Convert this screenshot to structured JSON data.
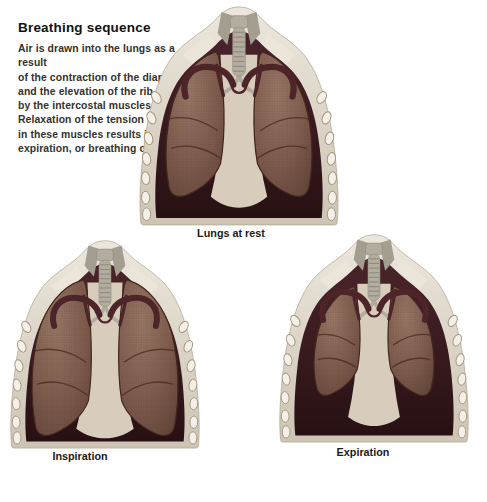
{
  "intro": {
    "title": "Breathing sequence",
    "lines": [
      "Air is drawn into the lungs as a result",
      "of the contraction of the diaphragm",
      "and the elevation of the rib cage",
      "by the intercostal muscles.",
      "Relaxation of the tension",
      "in these muscles results in",
      "expiration, or breathing out."
    ]
  },
  "figures": [
    {
      "id": "rest",
      "caption": "Lungs at rest"
    },
    {
      "id": "inspiration",
      "caption": "Inspiration"
    },
    {
      "id": "expiration",
      "caption": "Expiration"
    }
  ],
  "colors": {
    "background": "#ffffff",
    "text": "#35322e",
    "wall_light": "#ece7dd",
    "wall_dark": "#cdc4b3",
    "wall_stroke": "#b2a691",
    "cavity_top": "#4a252b",
    "cavity_bottom": "#271013",
    "lung_light": "#967663",
    "lung_mid": "#7c5a4c",
    "lung_dark": "#5c4034",
    "lung_stroke": "#44271e",
    "fissure": "#4a2c22",
    "mediastinum": "#d8cdbd",
    "trachea": "#b3ada0",
    "trachea_ring": "#8c8679",
    "vessel": "#4d2528",
    "rib_fill": "#f4f0e8",
    "rib_stroke": "#a4947f",
    "muscle": "#a49e91",
    "muscle_light": "#b1ab9e",
    "clavicle": "#ece6da"
  }
}
